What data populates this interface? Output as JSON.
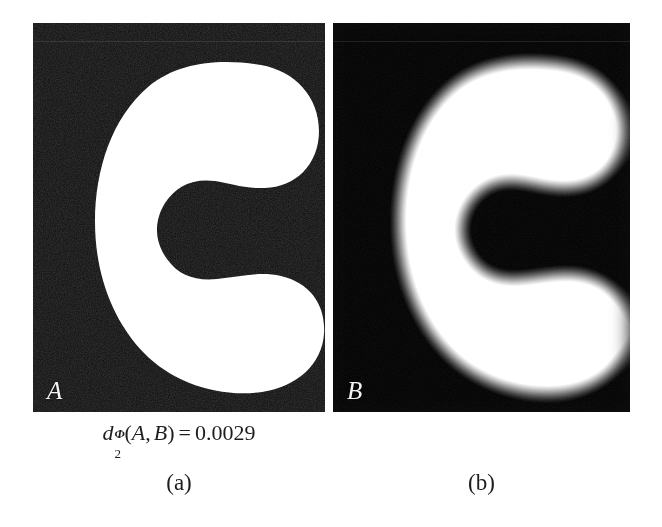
{
  "figure": {
    "background_color": "#ffffff",
    "panel_background_color": "#050505",
    "shape_color": "#ffffff",
    "text_color": "#1d1d1d"
  },
  "panels": [
    {
      "id": "a",
      "letter": "A",
      "caption": "(a)",
      "kind": "binary-crescent-shape",
      "description": "sharp binary crescent"
    },
    {
      "id": "b",
      "letter": "B",
      "caption": "(b)",
      "kind": "blurred-crescent-shape",
      "description": "gaussian blurred crescent"
    }
  ],
  "formula": {
    "symbol": "d",
    "subscript": "2",
    "superscript": "Φ",
    "open_paren": "(",
    "arg1": "A",
    "comma": ",",
    "arg2": "B",
    "close_paren": ")",
    "equals": "=",
    "value": "0.0029",
    "plain": "d_2^Φ(A, B) = 0.0029"
  }
}
